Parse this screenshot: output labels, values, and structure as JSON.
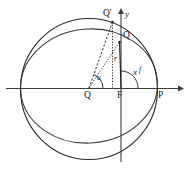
{
  "figure": {
    "kind": "geometry-diagram",
    "background_color": "#ffffff",
    "line_color": "#2b2b2b",
    "width": 187,
    "height": 170
  },
  "axes": {
    "x_label": "x",
    "y_label": "y",
    "x_axis_y": 88,
    "y_axis_x": 121,
    "x_axis_start": 6,
    "x_axis_end": 181,
    "y_axis_top": 8,
    "y_axis_bottom": 162
  },
  "points": [
    {
      "id": "Q-center",
      "label": "Q",
      "x": 89,
      "y": 88,
      "label_dx": -4,
      "label_dy": 4
    },
    {
      "id": "F-focus",
      "label": "F",
      "x": 121,
      "y": 88,
      "label_dx": -4,
      "label_dy": 4
    },
    {
      "id": "P-vertex",
      "label": "P",
      "x": 157,
      "y": 88,
      "label_dx": 1,
      "label_dy": 4
    },
    {
      "id": "Q-ellipse",
      "label": "Q",
      "x": 120,
      "y": 41,
      "label_dx": 3,
      "label_dy": -9
    },
    {
      "id": "Q-circle",
      "label": "Q'",
      "x": 112,
      "y": 21,
      "label_dx": -2,
      "label_dy": -12
    }
  ],
  "angles": [
    {
      "id": "eccentric-anomaly",
      "label": "u",
      "vertex": "Q-center",
      "radius": 13
    },
    {
      "id": "true-anomaly",
      "label": "f",
      "vertex": "F-focus",
      "radius": 17
    }
  ],
  "segments": [
    {
      "id": "focal-radius",
      "label": "r",
      "from": "F-focus",
      "to": "Q-ellipse",
      "style": "solid"
    },
    {
      "id": "center-to-circle-point",
      "label": "",
      "from": "Q-center",
      "to": "Q-circle",
      "style": "dashed"
    },
    {
      "id": "center-to-ellipse-point",
      "label": "",
      "from": "Q-center",
      "to": "Q-ellipse",
      "style": "dotted"
    },
    {
      "id": "ordinate-drop",
      "label": "",
      "from": "Q-circle",
      "to": "x-axis-foot",
      "style": "dotted"
    }
  ],
  "curves": [
    {
      "id": "auxiliary-circle",
      "type": "circle",
      "cx": 89,
      "cy": 88,
      "r": 70
    },
    {
      "id": "orbit-ellipse",
      "type": "ellipse",
      "cx": 89,
      "cy": 86,
      "rx": 68,
      "ry": 56,
      "rotation": -4
    }
  ]
}
